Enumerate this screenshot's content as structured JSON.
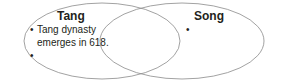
{
  "diagram": {
    "type": "venn",
    "stroke_color": "#8a8a8a",
    "sets": [
      {
        "label": "Tang",
        "bullets": [
          "Tang dynasty",
          "emerges in 618.",
          ""
        ]
      },
      {
        "label": "Song",
        "bullets": [
          ""
        ]
      }
    ],
    "bullet_glyph": "•"
  }
}
